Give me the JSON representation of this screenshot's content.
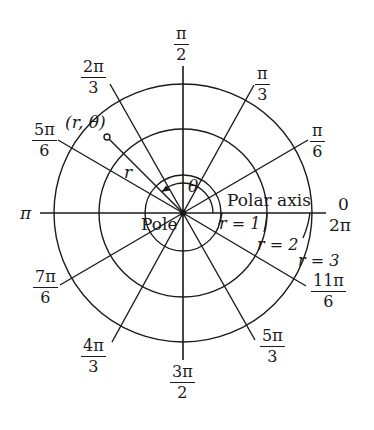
{
  "diagram": {
    "angle_labels": [
      {
        "id": "pi-over-2",
        "num": "π",
        "den": "2"
      },
      {
        "id": "2pi-over-3",
        "num": "2π",
        "den": "3"
      },
      {
        "id": "pi-over-3",
        "num": "π",
        "den": "3"
      },
      {
        "id": "5pi-over-6",
        "num": "5π",
        "den": "6"
      },
      {
        "id": "pi-over-6",
        "num": "π",
        "den": "6"
      },
      {
        "id": "7pi-over-6",
        "num": "7π",
        "den": "6"
      },
      {
        "id": "11pi-over-6",
        "num": "11π",
        "den": "6"
      },
      {
        "id": "4pi-over-3",
        "num": "4π",
        "den": "3"
      },
      {
        "id": "5pi-over-3",
        "num": "5π",
        "den": "3"
      },
      {
        "id": "3pi-over-2",
        "num": "3π",
        "den": "2"
      }
    ],
    "plain_labels": {
      "pi": "π",
      "zero": "0",
      "two_pi": "2π",
      "pole": "Pole",
      "polar_axis": "Polar axis",
      "theta": "θ",
      "r": "r",
      "point": "(r, θ)",
      "r1": "r = 1",
      "r2": "r = 2",
      "r3": "r = 3"
    },
    "circles": [
      {
        "label": "r = 1",
        "radius_units": 1
      },
      {
        "label": "r = 2",
        "radius_units": 2
      },
      {
        "label": "r = 3",
        "radius_units": 3
      }
    ],
    "rays_radians": [
      "0",
      "π/6",
      "π/3",
      "π/2",
      "2π/3",
      "5π/6",
      "π",
      "7π/6",
      "4π/3",
      "3π/2",
      "5π/3",
      "11π/6"
    ],
    "point": {
      "label": "(r, θ)",
      "angle": "3π/4"
    },
    "colors": {
      "ink": "#1a1a1a",
      "background": "#ffffff"
    }
  }
}
